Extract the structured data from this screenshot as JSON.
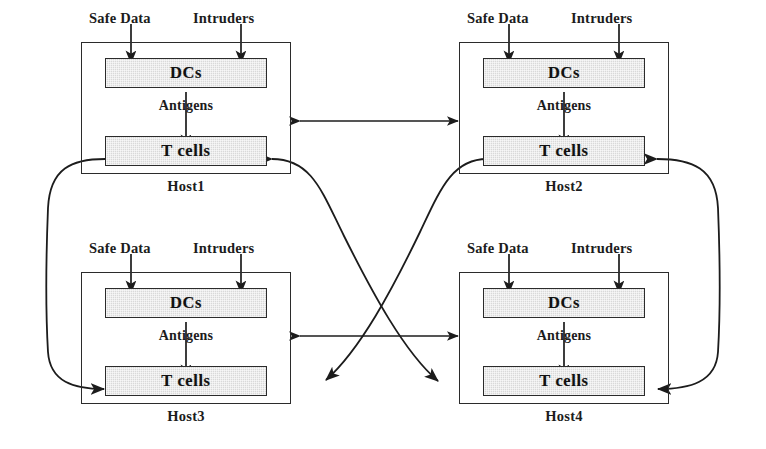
{
  "diagram": {
    "background_color": "#ffffff",
    "line_color": "#2b2b2b",
    "cell_fill_color": "#d9d9d9",
    "inputs": {
      "safe_data_label": "Safe Data",
      "intruders_label": "Intruders"
    },
    "stage_labels": {
      "dcs": "DCs",
      "antigens": "Antigens",
      "tcells": "T cells"
    },
    "hosts": [
      {
        "id": "host1",
        "label": "Host1",
        "position": "top-left"
      },
      {
        "id": "host2",
        "label": "Host2",
        "position": "top-right"
      },
      {
        "id": "host3",
        "label": "Host3",
        "position": "bottom-left"
      },
      {
        "id": "host4",
        "label": "Host4",
        "position": "bottom-right"
      }
    ],
    "connections": [
      {
        "id": "h1-h2",
        "from": "Host1",
        "to": "Host2",
        "style": "straight",
        "arrows": "both"
      },
      {
        "id": "h3-h4",
        "from": "Host3",
        "to": "Host4",
        "style": "straight",
        "arrows": "both"
      },
      {
        "id": "h1-h3",
        "from": "Host1",
        "to": "Host3",
        "style": "left-loop",
        "arrows": "both"
      },
      {
        "id": "h2-h4",
        "from": "Host2",
        "to": "Host4",
        "style": "right-loop",
        "arrows": "both"
      },
      {
        "id": "h1-h4",
        "from": "Host1",
        "to": "Host4",
        "style": "diagonal-curve",
        "arrows": "both"
      },
      {
        "id": "h2-h3",
        "from": "Host2",
        "to": "Host3",
        "style": "diagonal-curve",
        "arrows": "both"
      }
    ]
  }
}
